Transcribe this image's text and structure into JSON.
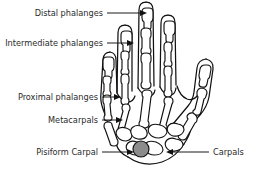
{
  "figure": {
    "background_color": "#ffffff",
    "line_color": "#111111",
    "text_color": "#2b2b2b",
    "pisiform_fill_color": "#8c8c8c"
  },
  "labels": [
    {
      "id": "distal-phalanges",
      "text": "Distal phalanges",
      "side": "left"
    },
    {
      "id": "intermediate-phalanges",
      "text": "Intermediate phalanges",
      "side": "left"
    },
    {
      "id": "proximal-phalanges",
      "text": "Proximal phalanges",
      "side": "left"
    },
    {
      "id": "metacarpals",
      "text": "Metacarpals",
      "side": "left"
    },
    {
      "id": "pisiform-carpal",
      "text": "Pisiform Carpal",
      "side": "left"
    },
    {
      "id": "carpals",
      "text": "Carpals",
      "side": "right"
    }
  ]
}
